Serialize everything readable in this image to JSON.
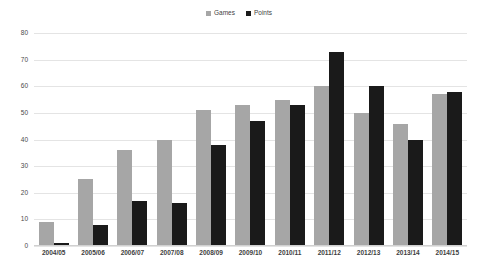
{
  "chart_data": {
    "type": "bar",
    "title": "",
    "xlabel": "",
    "ylabel": "",
    "ylim": [
      0,
      80
    ],
    "yticks": [
      80,
      70,
      60,
      50,
      40,
      30,
      20,
      10,
      0
    ],
    "grid": true,
    "legend_position": "top-center",
    "categories": [
      "2004/05",
      "2005/06",
      "2006/07",
      "2007/08",
      "2008/09",
      "2009/10",
      "2010/11",
      "2011/12",
      "2012/13",
      "2013/14",
      "2014/15"
    ],
    "series": [
      {
        "name": "Games",
        "color": "#a6a6a6",
        "values": [
          9,
          25,
          36,
          40,
          51,
          53,
          55,
          60,
          50,
          46,
          57
        ]
      },
      {
        "name": "Points",
        "color": "#1a1a1a",
        "values": [
          1,
          8,
          17,
          16,
          38,
          47,
          53,
          73,
          60,
          40,
          58
        ]
      }
    ]
  }
}
